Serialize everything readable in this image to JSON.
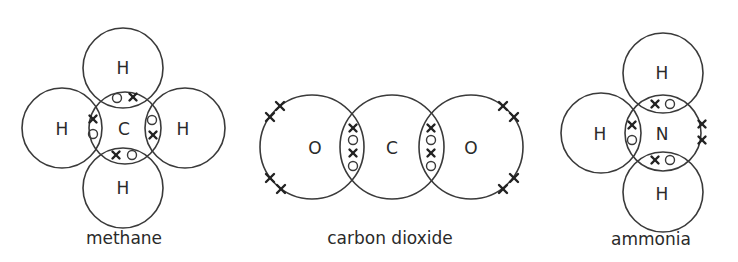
{
  "molecules": [
    {
      "name": "methane",
      "caption": "methane",
      "atoms": [
        {
          "symbol": "C",
          "role": "central"
        },
        {
          "symbol": "H",
          "position": "top"
        },
        {
          "symbol": "H",
          "position": "left"
        },
        {
          "symbol": "H",
          "position": "right"
        },
        {
          "symbol": "H",
          "position": "bottom"
        }
      ],
      "shared_pairs": 4,
      "lone_pairs": 0
    },
    {
      "name": "carbon-dioxide",
      "caption": "carbon dioxide",
      "atoms": [
        {
          "symbol": "O",
          "position": "left"
        },
        {
          "symbol": "C",
          "role": "central"
        },
        {
          "symbol": "O",
          "position": "right"
        }
      ],
      "shared_pairs": 4,
      "lone_pairs": 4
    },
    {
      "name": "ammonia",
      "caption": "ammonia",
      "atoms": [
        {
          "symbol": "N",
          "role": "central"
        },
        {
          "symbol": "H",
          "position": "top"
        },
        {
          "symbol": "H",
          "position": "left"
        },
        {
          "symbol": "H",
          "position": "bottom"
        }
      ],
      "shared_pairs": 3,
      "lone_pairs": 1
    }
  ],
  "legend": {
    "cross": "electron from one atom",
    "circle": "electron from other atom"
  }
}
